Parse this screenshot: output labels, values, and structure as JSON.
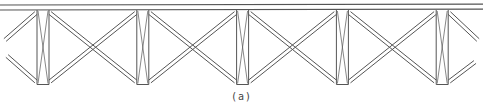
{
  "diagram": {
    "type": "truss-elevation",
    "caption": "(a)",
    "line_color": "#555555",
    "panel_count": 4,
    "post_count": 5,
    "posts_have_cross_bracing": true,
    "diagonals_are_double_lines": true
  }
}
